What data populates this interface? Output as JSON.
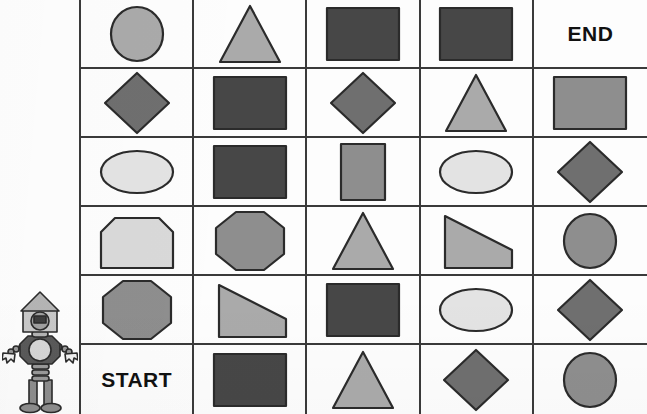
{
  "worksheet": {
    "title": "Shape Maze",
    "start_label": "START",
    "end_label": "END"
  },
  "palette": {
    "shape_dark": "#474747",
    "shape_mid": "#6f6f6f",
    "shape_gray": "#8e8e8e",
    "shape_light_gray": "#aaaaaa",
    "shape_pale": "#d9d9d9",
    "shape_pale_light": "#e3e3e3",
    "outline": "#2b2b2b",
    "grid_line": "#3a3a3a",
    "paper": "#fdfdfd",
    "text": "#111111"
  },
  "grid": {
    "rows": 6,
    "columns": 5,
    "cells": [
      [
        {
          "shape": "circle",
          "fill": "#aaaaaa",
          "label": ""
        },
        {
          "shape": "triangle",
          "fill": "#aaaaaa",
          "label": ""
        },
        {
          "shape": "rectangle",
          "fill": "#474747",
          "label": ""
        },
        {
          "shape": "rectangle",
          "fill": "#474747",
          "label": ""
        },
        {
          "shape": "text",
          "fill": "",
          "label": "END"
        }
      ],
      [
        {
          "shape": "diamond",
          "fill": "#6f6f6f",
          "label": ""
        },
        {
          "shape": "rectangle",
          "fill": "#474747",
          "label": ""
        },
        {
          "shape": "diamond",
          "fill": "#6f6f6f",
          "label": ""
        },
        {
          "shape": "triangle",
          "fill": "#aaaaaa",
          "label": ""
        },
        {
          "shape": "rectangle",
          "fill": "#8e8e8e",
          "label": ""
        }
      ],
      [
        {
          "shape": "ellipse",
          "fill": "#e3e3e3",
          "label": ""
        },
        {
          "shape": "rectangle",
          "fill": "#474747",
          "label": ""
        },
        {
          "shape": "square",
          "fill": "#8e8e8e",
          "label": ""
        },
        {
          "shape": "ellipse",
          "fill": "#e3e3e3",
          "label": ""
        },
        {
          "shape": "diamond",
          "fill": "#6f6f6f",
          "label": ""
        }
      ],
      [
        {
          "shape": "hexagon",
          "fill": "#d9d9d9",
          "label": ""
        },
        {
          "shape": "octagon",
          "fill": "#8e8e8e",
          "label": ""
        },
        {
          "shape": "triangle",
          "fill": "#aaaaaa",
          "label": ""
        },
        {
          "shape": "trapezoid",
          "fill": "#aaaaaa",
          "label": ""
        },
        {
          "shape": "circle",
          "fill": "#8e8e8e",
          "label": ""
        }
      ],
      [
        {
          "shape": "octagon",
          "fill": "#8e8e8e",
          "label": ""
        },
        {
          "shape": "trapezoid",
          "fill": "#aaaaaa",
          "label": ""
        },
        {
          "shape": "rectangle",
          "fill": "#474747",
          "label": ""
        },
        {
          "shape": "ellipse",
          "fill": "#e3e3e3",
          "label": ""
        },
        {
          "shape": "diamond",
          "fill": "#6f6f6f",
          "label": ""
        }
      ],
      [
        {
          "shape": "text",
          "fill": "",
          "label": "START"
        },
        {
          "shape": "rectangle",
          "fill": "#474747",
          "label": ""
        },
        {
          "shape": "triangle",
          "fill": "#aaaaaa",
          "label": ""
        },
        {
          "shape": "diamond",
          "fill": "#6f6f6f",
          "label": ""
        },
        {
          "shape": "circle",
          "fill": "#8e8e8e",
          "label": ""
        }
      ]
    ]
  },
  "robot": {
    "name": "robot-mascot",
    "head_fill": "#c9c9c9",
    "body_fill": "#5a5a5a",
    "accent_fill": "#d7d7d7",
    "outline": "#2b2b2b"
  }
}
